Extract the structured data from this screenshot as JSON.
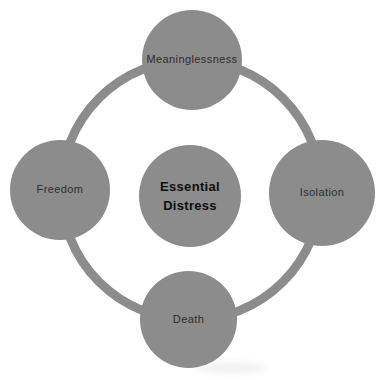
{
  "diagram": {
    "center": {
      "label_lines": [
        "Essential",
        "Distress"
      ]
    },
    "nodes": [
      {
        "id": "top",
        "label": "Meaninglessness"
      },
      {
        "id": "right",
        "label": "Isolation"
      },
      {
        "id": "bottom",
        "label": "Death"
      },
      {
        "id": "left",
        "label": "Freedom"
      }
    ],
    "colors": {
      "circle_fill": "#8c8c8c",
      "ring_stroke": "#8c8c8c",
      "outer_label_text": "#2e2e2e",
      "center_label_text": "#0f0f0f",
      "background": "#ffffff"
    }
  }
}
